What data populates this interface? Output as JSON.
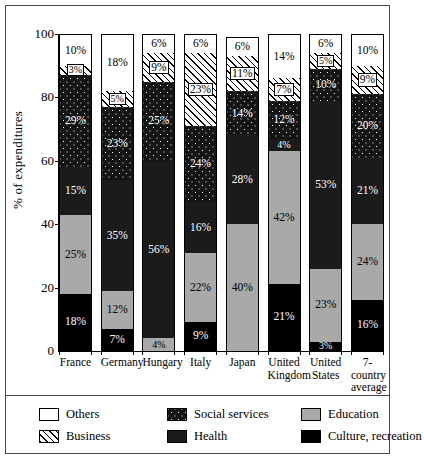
{
  "chart_data": {
    "type": "bar",
    "subtype": "stacked-bar-100",
    "title": "",
    "xlabel": "",
    "ylabel": "% of expenditures",
    "ylim": [
      0,
      100
    ],
    "yticks": [
      0,
      20,
      40,
      60,
      80,
      100
    ],
    "grid": false,
    "legend_position": "bottom",
    "categories": [
      "France",
      "Germany",
      "Hungary",
      "Italy",
      "Japan",
      "United Kingdom",
      "United States",
      "7-country average"
    ],
    "category_lines": [
      [
        "France"
      ],
      [
        "Germany"
      ],
      [
        "Hungary"
      ],
      [
        "Italy"
      ],
      [
        "Japan"
      ],
      [
        "United",
        "Kingdom"
      ],
      [
        "United",
        "States"
      ],
      [
        "7-country",
        "average"
      ]
    ],
    "series": [
      {
        "name": "Others",
        "key": "others",
        "fill": "white",
        "values": [
          10,
          18,
          6,
          6,
          6,
          14,
          6,
          10
        ],
        "labels": [
          "10%",
          "18%",
          "6%",
          "6%",
          "6%",
          "14%",
          "6%",
          "10%"
        ]
      },
      {
        "name": "Business",
        "key": "business",
        "fill": "diagonal-hatch",
        "values": [
          3,
          5,
          9,
          23,
          11,
          7,
          5,
          9
        ],
        "labels": [
          "3%",
          "5%",
          "9%",
          "23%",
          "11%",
          "7%",
          "5%",
          "9%"
        ]
      },
      {
        "name": "Social services",
        "key": "social",
        "fill": "dark-dotted",
        "values": [
          29,
          23,
          25,
          24,
          14,
          12,
          10,
          20
        ],
        "labels": [
          "29%",
          "23%",
          "25%",
          "24%",
          "14%",
          "12%",
          "10%",
          "20%"
        ]
      },
      {
        "name": "Health",
        "key": "health",
        "fill": "dark-solid",
        "values": [
          15,
          35,
          56,
          16,
          28,
          4,
          53,
          21
        ],
        "labels": [
          "15%",
          "35%",
          "56%",
          "16%",
          "28%",
          "4%",
          "53%",
          "21%"
        ]
      },
      {
        "name": "Education",
        "key": "education",
        "fill": "gray",
        "values": [
          25,
          12,
          4,
          22,
          40,
          42,
          23,
          24
        ],
        "labels": [
          "25%",
          "12%",
          "4%",
          "22%",
          "40%",
          "42%",
          "23%",
          "24%"
        ]
      },
      {
        "name": "Culture, recreation",
        "key": "culture",
        "fill": "black",
        "values": [
          18,
          7,
          0,
          9,
          0,
          21,
          3,
          16
        ],
        "labels": [
          "18%",
          "7%",
          "",
          "9%",
          "",
          "21%",
          "3%",
          "16%"
        ]
      }
    ]
  },
  "axis": {
    "y_label": "% of expenditures",
    "y_ticks": [
      "100",
      "80",
      "60",
      "40",
      "20",
      "0"
    ]
  },
  "legend": {
    "items": [
      {
        "label": "Others",
        "swatch": "others-swatch"
      },
      {
        "label": "Social services",
        "swatch": "social-services-swatch"
      },
      {
        "label": "Education",
        "swatch": "education-swatch"
      },
      {
        "label": "Business",
        "swatch": "business-swatch"
      },
      {
        "label": "Health",
        "swatch": "health-swatch"
      },
      {
        "label": "Culture, recreation",
        "swatch": "culture-recreation-swatch"
      }
    ]
  }
}
